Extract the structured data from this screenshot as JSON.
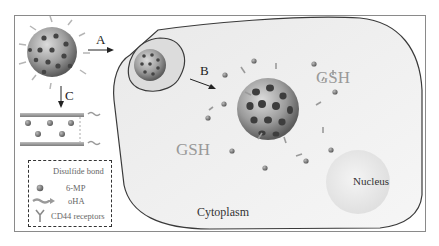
{
  "diagram": {
    "type": "nanoparticle cellular uptake schematic",
    "steps": [
      {
        "id": "A",
        "label": "A"
      },
      {
        "id": "B",
        "label": "B"
      },
      {
        "id": "C",
        "label": "C"
      }
    ],
    "regions": {
      "gsh_upper": "GSH",
      "gsh_lower": "GSH",
      "cytoplasm": "Cytoplasm",
      "nucleus": "Nucleus"
    },
    "legend": {
      "items": [
        {
          "icon": "disulfide-bond-icon",
          "label": "Disulfide bond"
        },
        {
          "icon": "6mp-drug-icon",
          "label": "6-MP"
        },
        {
          "icon": "ohA-chain-icon",
          "label": "oHA"
        },
        {
          "icon": "cd44-receptor-icon",
          "label": "CD44 receptors"
        }
      ]
    },
    "colors": {
      "frame": "#8a8a8a",
      "cell_fill": "#ececec",
      "membrane": "#3a3a3a",
      "particle": "#9a9a9a",
      "pore": "#3d3d3d",
      "drug_dot": "#7a7a7a",
      "gsh_text": "#999999"
    }
  }
}
